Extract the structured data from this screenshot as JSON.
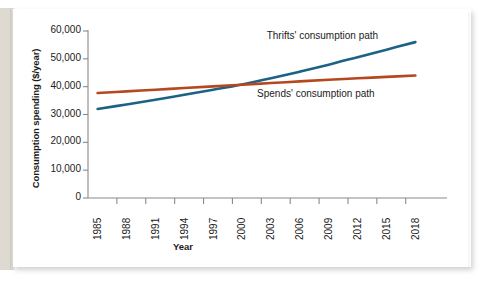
{
  "chart_data": {
    "type": "line",
    "title": "",
    "xlabel": "Year",
    "ylabel": "Consumption spending ($/year)",
    "xlim": [
      1985,
      2020
    ],
    "ylim": [
      0,
      60000
    ],
    "grid": false,
    "legend_position": "inline-annotation",
    "y_ticks": [
      "0",
      "10,000",
      "20,000",
      "30,000",
      "40,000",
      "50,000",
      "60,000"
    ],
    "y_tick_values": [
      0,
      10000,
      20000,
      30000,
      40000,
      50000,
      60000
    ],
    "x_ticks": [
      "1985",
      "1988",
      "1991",
      "1994",
      "1997",
      "2000",
      "2003",
      "2006",
      "2009",
      "2012",
      "2015",
      "2018"
    ],
    "x_tick_values": [
      1985,
      1988,
      1991,
      1994,
      1997,
      2000,
      2003,
      2006,
      2009,
      2012,
      2015,
      2018
    ],
    "annotations": [
      {
        "text": "Thrifts' consumption path",
        "x": 2010,
        "y": 58000
      },
      {
        "text": "Spends' consumption path",
        "x": 2009,
        "y": 37000
      }
    ],
    "series": [
      {
        "name": "Thrifts' consumption path",
        "color": "#1b6285",
        "x": [
          1986,
          1989,
          1992,
          1995,
          1998,
          2001,
          2004,
          2007,
          2010,
          2013,
          2016,
          2019
        ],
        "values": [
          32000,
          33600,
          35300,
          37100,
          38900,
          40800,
          43000,
          45400,
          47900,
          50600,
          53300,
          56000
        ]
      },
      {
        "name": "Spends' consumption path",
        "color": "#b5481f",
        "x": [
          1986,
          1989,
          1992,
          1995,
          1998,
          2001,
          2004,
          2007,
          2010,
          2013,
          2016,
          2019
        ],
        "values": [
          37700,
          38300,
          38900,
          39500,
          40100,
          40700,
          41300,
          41900,
          42500,
          43000,
          43500,
          44000
        ]
      }
    ]
  },
  "axes": {
    "y_title": "Consumption spending ($/year)",
    "x_title": "Year"
  },
  "colors": {
    "thrifts_line": "#1b6285",
    "spends_line": "#b5481f",
    "axis": "#8a8a8a",
    "text": "#1b1b1b",
    "card": "#ffffff",
    "page_gutter": "#dedad2"
  }
}
